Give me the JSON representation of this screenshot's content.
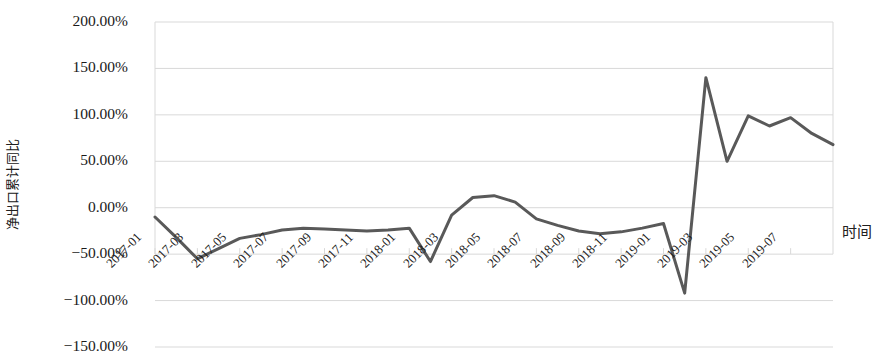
{
  "chart_data": {
    "type": "line",
    "title": "",
    "xlabel": "时间",
    "ylabel": "净出口累计同比",
    "ylim": [
      -150,
      200
    ],
    "ytick_labels": [
      "200.00%",
      "150.00%",
      "100.00%",
      "50.00%",
      "0.00%",
      "-50.00%",
      "-100.00%",
      "-150.00%"
    ],
    "ytick_values": [
      200,
      150,
      100,
      50,
      0,
      -50,
      -100,
      -150
    ],
    "grid": true,
    "legend": "none",
    "line_color": "#595959",
    "grid_color": "#d9d9d9",
    "x": [
      "2017-01",
      "2017-02",
      "2017-03",
      "2017-04",
      "2017-05",
      "2017-06",
      "2017-07",
      "2017-08",
      "2017-09",
      "2017-10",
      "2017-11",
      "2017-12",
      "2018-01",
      "2018-02",
      "2018-03",
      "2018-04",
      "2018-05",
      "2018-06",
      "2018-07",
      "2018-08",
      "2018-09",
      "2018-10",
      "2018-11",
      "2018-12",
      "2019-01",
      "2019-02",
      "2019-03",
      "2019-04",
      "2019-05",
      "2019-06",
      "2019-07",
      "2019-08",
      "2019-09"
    ],
    "x_tick_labels": [
      "2017-01",
      "2017-03",
      "2017-05",
      "2017-07",
      "2017-09",
      "2017-11",
      "2018-01",
      "2018-03",
      "2018-05",
      "2018-07",
      "2018-09",
      "2018-11",
      "2019-01",
      "2019-03",
      "2019-05",
      "2019-07"
    ],
    "values": [
      -10,
      -32,
      -55,
      -44,
      -33,
      -29,
      -24,
      -22,
      -23,
      -24,
      -25,
      -24,
      -22,
      -58,
      -8,
      11,
      13,
      6,
      -12,
      -19,
      -25,
      -28,
      -26,
      -22,
      -17,
      -92,
      140,
      50,
      99,
      88,
      97,
      80,
      68
    ],
    "series": [
      {
        "name": "净出口累计同比",
        "values": [
          -10,
          -32,
          -55,
          -44,
          -33,
          -29,
          -24,
          -22,
          -23,
          -24,
          -25,
          -24,
          -22,
          -58,
          -8,
          11,
          13,
          6,
          -12,
          -19,
          -25,
          -28,
          -26,
          -22,
          -17,
          -92,
          140,
          50,
          99,
          88,
          97,
          80,
          68
        ]
      }
    ]
  }
}
